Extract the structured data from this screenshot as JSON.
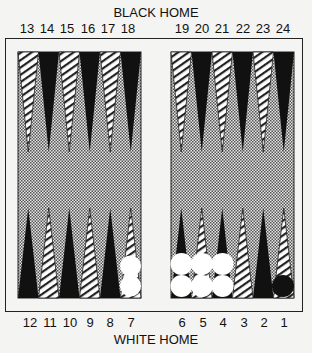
{
  "titles": {
    "top": "BLACK HOME",
    "bottom": "WHITE HOME"
  },
  "top_points": [
    "13",
    "14",
    "15",
    "16",
    "17",
    "18",
    "19",
    "20",
    "21",
    "22",
    "23",
    "24"
  ],
  "bottom_points": [
    "12",
    "11",
    "10",
    "9",
    "8",
    "7",
    "6",
    "5",
    "4",
    "3",
    "2",
    "1"
  ],
  "colors": {
    "dark_point": "#111111",
    "light_point": "#ffffff",
    "stripe": "#222222",
    "felt_dot": "#555555",
    "felt_bg": "#dcdcdc",
    "frame": "#222222",
    "white_checker": "#ffffff",
    "black_checker": "#111111"
  },
  "checkers": [
    {
      "point": "7",
      "color": "white",
      "count": 2
    },
    {
      "point": "6",
      "color": "white",
      "count": 2
    },
    {
      "point": "5",
      "color": "white",
      "count": 2
    },
    {
      "point": "4",
      "color": "white",
      "count": 2
    },
    {
      "point": "1",
      "color": "black",
      "count": 1
    }
  ]
}
